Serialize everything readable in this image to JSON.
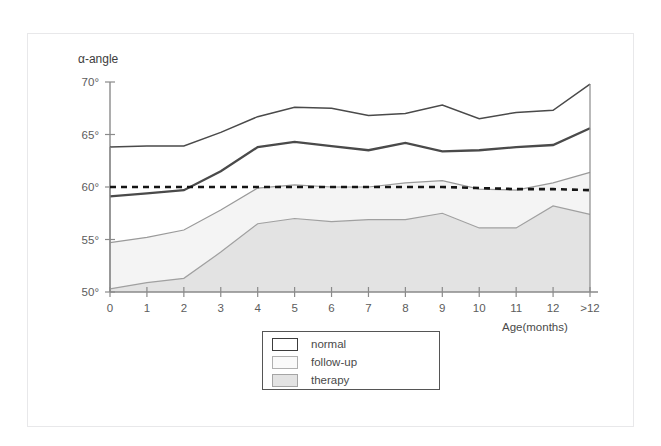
{
  "figure": {
    "y_axis_title": "α-angle",
    "x_axis_title": "Age(months)"
  },
  "legend": {
    "items": [
      {
        "label": "normal",
        "swatch": "normal-swatch"
      },
      {
        "label": "follow-up",
        "swatch": "followup-swatch"
      },
      {
        "label": "therapy",
        "swatch": "therapy-swatch"
      }
    ]
  },
  "axis": {
    "y_ticks": [
      "70°",
      "65°",
      "60°",
      "55°",
      "50°"
    ],
    "x_ticks": [
      "0",
      "1",
      "2",
      "3",
      "4",
      "5",
      "6",
      "7",
      "8",
      "9",
      "10",
      "11",
      "12",
      ">12"
    ]
  },
  "colors": {
    "normal_line": "#4a4a4a",
    "followup_line": "#9a9a9a",
    "followup_fill": "#f4f4f4",
    "therapy_line": "#a0a0a0",
    "therapy_fill": "#e3e3e3",
    "reference_line": "#151515",
    "axis": "#8a8a8a"
  },
  "chart_data": {
    "type": "line",
    "title": "",
    "subtitle": "",
    "xlabel": "Age(months)",
    "ylabel": "α-angle",
    "xlim": [
      0,
      13
    ],
    "ylim": [
      50,
      70
    ],
    "grid": false,
    "legend_position": "bottom-center",
    "categories": [
      "0",
      "1",
      "2",
      "3",
      "4",
      "5",
      "6",
      "7",
      "8",
      "9",
      "10",
      "11",
      "12",
      ">12"
    ],
    "x": [
      0,
      1,
      2,
      3,
      4,
      5,
      6,
      7,
      8,
      9,
      10,
      11,
      12,
      13
    ],
    "series": [
      {
        "name": "normal upper",
        "style": "thin-dark-line",
        "values": [
          63.8,
          63.9,
          63.9,
          65.2,
          66.7,
          67.6,
          67.5,
          66.8,
          67.0,
          67.8,
          66.5,
          67.1,
          67.3,
          69.8
        ]
      },
      {
        "name": "normal lower",
        "style": "thick-dark-line",
        "values": [
          59.1,
          59.4,
          59.7,
          61.5,
          63.8,
          64.3,
          63.9,
          63.5,
          64.2,
          63.4,
          63.5,
          63.8,
          64.0,
          65.6
        ]
      },
      {
        "name": "follow-up upper",
        "style": "thin-gray-line-filled",
        "values": [
          54.7,
          55.2,
          55.9,
          57.8,
          59.9,
          60.2,
          60.0,
          60.0,
          60.4,
          60.6,
          59.8,
          59.7,
          60.4,
          61.4
        ]
      },
      {
        "name": "therapy upper",
        "style": "thin-gray-line-filled",
        "values": [
          50.3,
          50.9,
          51.3,
          53.8,
          56.5,
          57.0,
          56.7,
          56.9,
          56.9,
          57.5,
          56.1,
          56.1,
          58.2,
          57.4
        ]
      },
      {
        "name": "reference 60°",
        "style": "dashed-black-line",
        "values": [
          60.0,
          60.0,
          60.0,
          60.0,
          60.0,
          60.0,
          60.0,
          60.0,
          60.0,
          60.0,
          59.9,
          59.8,
          59.8,
          59.7
        ]
      }
    ],
    "annotations": []
  }
}
